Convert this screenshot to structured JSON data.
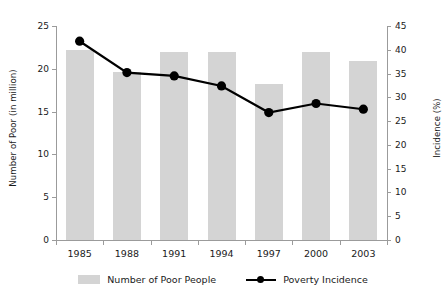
{
  "chart_data": {
    "type": "bar",
    "title": "",
    "categories": [
      "1985",
      "1988",
      "1991",
      "1994",
      "1997",
      "2000",
      "2003"
    ],
    "xlabel": "",
    "ylabel": "Number of Poor (in million)",
    "ylabel_right": "Incidence (%)",
    "ylim": [
      0,
      25
    ],
    "ylim_right": [
      0,
      45
    ],
    "yticks": [
      0,
      5,
      10,
      15,
      20,
      25
    ],
    "yticks_right": [
      0,
      5,
      10,
      15,
      20,
      25,
      30,
      35,
      40,
      45
    ],
    "grid": false,
    "legend_position": "bottom",
    "series": [
      {
        "name": "Number of Poor People",
        "type": "bar",
        "axis": "left",
        "color": "#d4d4d4",
        "values": [
          22.2,
          19.6,
          22.0,
          22.0,
          18.2,
          22.0,
          20.9
        ]
      },
      {
        "name": "Poverty Incidence",
        "type": "line",
        "axis": "right",
        "color": "#000000",
        "values": [
          41.8,
          35.2,
          34.5,
          32.4,
          26.8,
          28.7,
          27.5
        ]
      }
    ]
  },
  "legend": {
    "items": [
      {
        "label": "Number of Poor People"
      },
      {
        "label": "Poverty Incidence"
      }
    ]
  }
}
